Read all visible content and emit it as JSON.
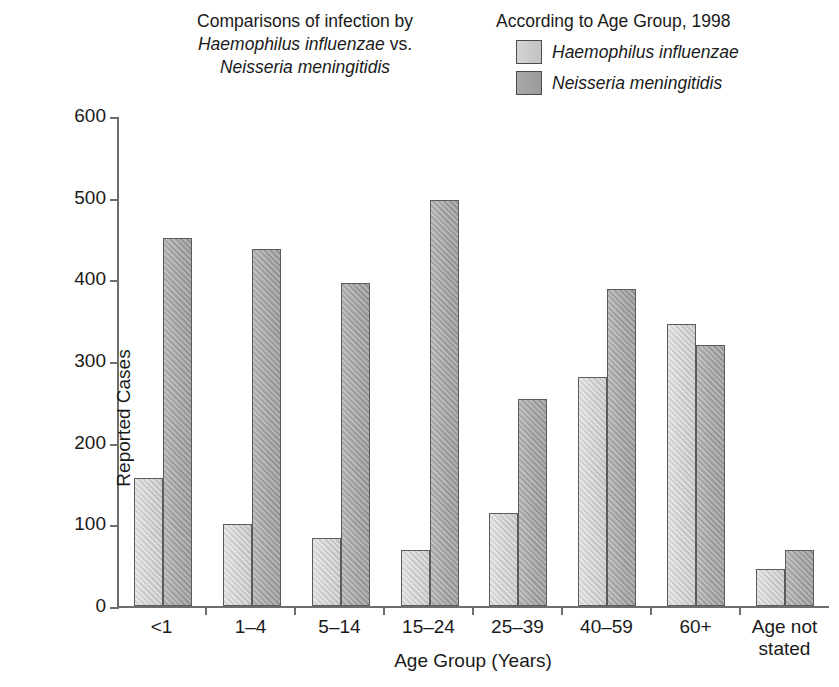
{
  "title": {
    "line1": "Comparisons of infection by",
    "line2_italic": "Haemophilus influenzae",
    "line2_rest": " vs.",
    "line3_italic": "Neisseria meningitidis"
  },
  "legend": {
    "heading": "According to Age Group, 1998",
    "entries": [
      {
        "label": "Haemophilus influenzae",
        "color": "#cdcdcd"
      },
      {
        "label": "Neisseria meningitidis",
        "color": "#a2a2a2"
      }
    ]
  },
  "axes": {
    "ylabel": "Reported Cases",
    "xlabel": "Age Group (Years)",
    "yticks": [
      "0",
      "100",
      "200",
      "300",
      "400",
      "500",
      "600"
    ]
  },
  "chart_data": {
    "type": "bar",
    "title": "Comparisons of infection by Haemophilus influenzae vs. Neisseria meningitidis According to Age Group, 1998",
    "xlabel": "Age Group (Years)",
    "ylabel": "Reported Cases",
    "ylim": [
      0,
      600
    ],
    "ytick_step": 100,
    "grid": false,
    "legend_position": "top-right",
    "categories": [
      "<1",
      "1–4",
      "5–14",
      "15–24",
      "25–39",
      "40–59",
      "60+",
      "Age not\nstated"
    ],
    "category_labels": [
      {
        "line1": "<1",
        "line2": ""
      },
      {
        "line1": "1–4",
        "line2": ""
      },
      {
        "line1": "5–14",
        "line2": ""
      },
      {
        "line1": "15–24",
        "line2": ""
      },
      {
        "line1": "25–39",
        "line2": ""
      },
      {
        "line1": "40–59",
        "line2": ""
      },
      {
        "line1": "60+",
        "line2": ""
      },
      {
        "line1": "Age not",
        "line2": "stated"
      }
    ],
    "series": [
      {
        "name": "Haemophilus influenzae",
        "color": "#cdcdcd",
        "values": [
          157,
          100,
          83,
          69,
          114,
          280,
          345,
          45
        ]
      },
      {
        "name": "Neisseria meningitidis",
        "color": "#a2a2a2",
        "values": [
          451,
          437,
          396,
          497,
          253,
          388,
          320,
          68
        ]
      }
    ]
  }
}
